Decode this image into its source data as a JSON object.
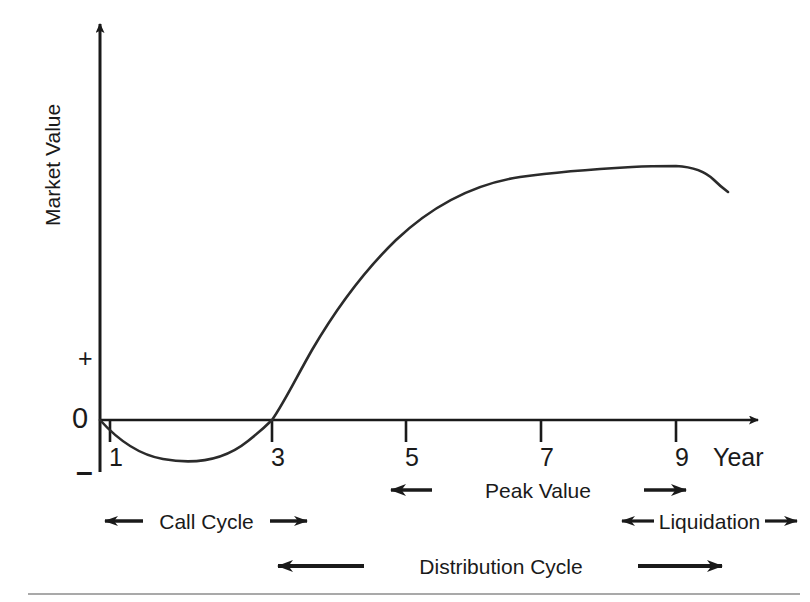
{
  "chart_data": {
    "type": "line",
    "title": "",
    "xlabel": "Year",
    "ylabel": "Market Value",
    "xlim": [
      0,
      10.2
    ],
    "ylim": [
      -1.15,
      4.3
    ],
    "grid": false,
    "legend": null,
    "x_ticks": [
      "1",
      "3",
      "5",
      "7",
      "9"
    ],
    "x_tick_values": [
      1,
      3,
      5,
      7,
      9
    ],
    "y_ticks": [
      "+",
      "0",
      "–"
    ],
    "y_tick_values": [
      1.1,
      0,
      -1.05
    ],
    "series": [
      {
        "name": "Market Value (J-curve)",
        "x": [
          0.0,
          0.4,
          0.8,
          1.2,
          1.6,
          2.0,
          2.4,
          2.8,
          3.0,
          3.4,
          3.8,
          4.2,
          4.6,
          5.0,
          5.5,
          6.0,
          6.5,
          7.0,
          7.5,
          8.0,
          8.5,
          9.0,
          9.4,
          9.7
        ],
        "y": [
          0.0,
          -0.3,
          -0.52,
          -0.65,
          -0.69,
          -0.66,
          -0.52,
          -0.2,
          0.0,
          0.55,
          1.05,
          1.5,
          1.9,
          2.25,
          2.6,
          2.9,
          3.15,
          3.35,
          3.5,
          3.6,
          3.66,
          3.67,
          3.58,
          3.42
        ]
      }
    ],
    "annotations": [
      {
        "name": "call-cycle",
        "label": "Call Cycle",
        "from_year": 0.1,
        "to_year": 3.1,
        "direction": "both"
      },
      {
        "name": "peak-value",
        "label": "Peak Value",
        "from_year": 4.3,
        "to_year": 9.1,
        "direction": "both"
      },
      {
        "name": "liquidation",
        "label": "Liquidation",
        "from_year": 8.05,
        "to_year": 10.4,
        "direction": "both"
      },
      {
        "name": "distribution-cycle",
        "label": "Distribution Cycle",
        "from_year": 2.55,
        "to_year": 9.3,
        "direction": "both"
      }
    ]
  },
  "axes": {
    "y_axis_label": "Market Value",
    "x_axis_label": "Year",
    "y_plus_symbol": "+",
    "y_zero_symbol": "0",
    "y_minus_symbol": "–",
    "x_tick_1": "1",
    "x_tick_3": "3",
    "x_tick_5": "5",
    "x_tick_7": "7",
    "x_tick_9": "9"
  },
  "annotations": {
    "call_cycle": "Call Cycle",
    "peak_value": "Peak Value",
    "liquidation": "Liquidation",
    "distribution_cycle": "Distribution Cycle"
  },
  "colors": {
    "background": "#ffffff",
    "ink": "#1a1a1a",
    "curve": "#2b2b2b",
    "rule": "#8c8c8c"
  }
}
